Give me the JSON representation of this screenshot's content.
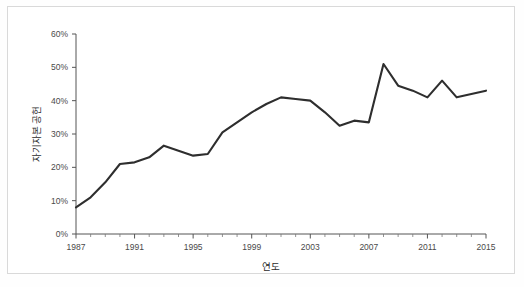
{
  "chart_data": {
    "type": "line",
    "title": "",
    "xlabel": "연도",
    "ylabel": "자기자본 공헌",
    "grid": false,
    "legend": "none",
    "xlim": [
      1987,
      2015
    ],
    "ylim": [
      0,
      60
    ],
    "y_tick_labels": [
      "0%",
      "10%",
      "20%",
      "30%",
      "40%",
      "50%",
      "60%"
    ],
    "y_tick_values": [
      0,
      10,
      20,
      30,
      40,
      50,
      60
    ],
    "x_tick_labels": [
      "1987",
      "1991",
      "1995",
      "1999",
      "2003",
      "2007",
      "2011",
      "2015"
    ],
    "x_tick_values": [
      1987,
      1991,
      1995,
      1999,
      2003,
      2007,
      2011,
      2015
    ],
    "x_minor_tick_values": [
      1988,
      1989,
      1990,
      1992,
      1993,
      1994,
      1996,
      1997,
      1998,
      2000,
      2001,
      2002,
      2004,
      2005,
      2006,
      2008,
      2009,
      2010,
      2012,
      2013,
      2014
    ],
    "series": [
      {
        "name": "자기자본 공헌",
        "color": "#2e2e2e",
        "x": [
          1987,
          1988,
          1989,
          1990,
          1991,
          1992,
          1993,
          1994,
          1995,
          1996,
          1997,
          1998,
          1999,
          2000,
          2001,
          2002,
          2003,
          2004,
          2005,
          2006,
          2007,
          2008,
          2009,
          2010,
          2011,
          2012,
          2013,
          2014,
          2015
        ],
        "values": [
          8.0,
          11.0,
          15.5,
          21.0,
          21.5,
          23.0,
          26.5,
          25.0,
          23.5,
          24.0,
          30.5,
          33.5,
          36.5,
          39.0,
          41.0,
          40.5,
          40.0,
          36.5,
          32.5,
          34.0,
          33.5,
          51.0,
          44.5,
          43.0,
          41.0,
          46.0,
          41.0,
          42.0,
          43.0
        ]
      }
    ]
  },
  "axes": {
    "y_title": "자기자본 공헌",
    "x_title": "연도"
  }
}
